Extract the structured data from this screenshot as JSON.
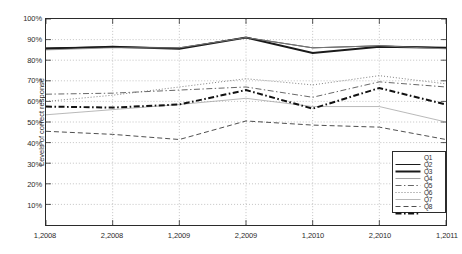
{
  "chart_data": {
    "type": "line",
    "title": "",
    "subtitle": "",
    "xlabel": "",
    "ylabel": "Levels of correct response",
    "categories": [
      "1,2008",
      "2,2008",
      "1,2009",
      "2,2009",
      "1,2010",
      "2,2010",
      "1,2011"
    ],
    "ylim": [
      0,
      100
    ],
    "ytick_labels": [
      "10%",
      "20%",
      "30%",
      "40%",
      "50%",
      "60%",
      "70%",
      "80%",
      "90%",
      "100%"
    ],
    "ytick_values": [
      10,
      20,
      30,
      40,
      50,
      60,
      70,
      80,
      90,
      100
    ],
    "grid": true,
    "grid_style": "dotted",
    "legend_position": "bottom-right",
    "legend_entries": [
      "Q1",
      "Q2",
      "Q3",
      "Q4",
      "Q5",
      "Q6",
      "Q7",
      "Q8"
    ],
    "series": [
      {
        "name": "Q1",
        "style": "solid",
        "width": 1.0,
        "color": "#1a1a1a",
        "values": [
          86,
          86.5,
          86,
          91,
          86,
          87,
          86
        ]
      },
      {
        "name": "Q2",
        "style": "solid",
        "width": 2.0,
        "color": "#1a1a1a",
        "values": [
          85.5,
          86.5,
          85.5,
          91,
          83.5,
          86.5,
          86
        ]
      },
      {
        "name": "Q3",
        "style": "solid",
        "width": 0.8,
        "color": "#8c8c8c",
        "values": [
          85,
          86,
          86,
          91,
          86,
          87,
          85.5
        ]
      },
      {
        "name": "Q4",
        "style": "dashdot",
        "width": 0.9,
        "color": "#555555",
        "values": [
          63.5,
          64,
          65.5,
          67,
          62,
          69.5,
          67
        ]
      },
      {
        "name": "Q5",
        "style": "dotted",
        "width": 0.9,
        "color": "#707070",
        "values": [
          60,
          63,
          67,
          71,
          68,
          72.5,
          68.5
        ]
      },
      {
        "name": "Q6",
        "style": "solid-thin",
        "width": 0.7,
        "color": "#9a9a9a",
        "values": [
          53.5,
          56,
          58.5,
          61.5,
          57.5,
          57.5,
          50
        ]
      },
      {
        "name": "Q7",
        "style": "dashed",
        "width": 0.9,
        "color": "#3a3a3a",
        "values": [
          45.5,
          44,
          41.5,
          50.5,
          48.5,
          47.5,
          41.5
        ]
      },
      {
        "name": "Q8",
        "style": "dashdot-bold",
        "width": 2.0,
        "color": "#111111",
        "values": [
          57.5,
          57,
          58.5,
          65.5,
          56.5,
          66.5,
          58.5
        ]
      }
    ]
  },
  "axes": {
    "y_title": "Levels of correct response"
  }
}
